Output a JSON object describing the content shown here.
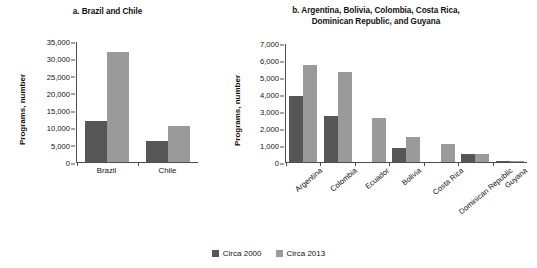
{
  "legend": {
    "items": [
      {
        "label": "Circa 2000",
        "color": "#565656"
      },
      {
        "label": "Circa 2013",
        "color": "#9a9a9a"
      }
    ]
  },
  "chart_data": [
    {
      "type": "bar",
      "panel": "a",
      "title": "a. Brazil and Chile",
      "xlabel": "",
      "ylabel": "Programs, number",
      "ylim": [
        0,
        35000
      ],
      "ytick_labels": [
        "0",
        "5,000",
        "10,000",
        "15,000",
        "20,000",
        "25,000",
        "30,000",
        "35,000"
      ],
      "ytick_values": [
        0,
        5000,
        10000,
        15000,
        20000,
        25000,
        30000,
        35000
      ],
      "grid": false,
      "legend_position": "bottom-center",
      "categories": [
        "Brazil",
        "Chile"
      ],
      "series": [
        {
          "name": "Circa 2000",
          "color": "#565656",
          "values": [
            12000,
            6200
          ]
        },
        {
          "name": "Circa 2013",
          "color": "#9a9a9a",
          "values": [
            32000,
            10500
          ]
        }
      ]
    },
    {
      "type": "bar",
      "panel": "b",
      "title": "b. Argentina, Bolivia, Colombia, Costa Rica, Dominican Republic, and Guyana",
      "title_line1": "b. Argentina, Bolivia, Colombia, Costa Rica,",
      "title_line2": "Dominican Republic, and Guyana",
      "xlabel": "",
      "ylabel": "Programs, number",
      "ylim": [
        0,
        7000
      ],
      "ytick_labels": [
        "0",
        "1,000",
        "2,000",
        "3,000",
        "4,000",
        "5,000",
        "6,000",
        "7,000"
      ],
      "ytick_values": [
        0,
        1000,
        2000,
        3000,
        4000,
        5000,
        6000,
        7000
      ],
      "grid": false,
      "legend_position": "bottom-center",
      "categories": [
        "Argentina",
        "Colombia",
        "Ecuador",
        "Bolivia",
        "Costa Rica",
        "Dominican Republic",
        "Guyana"
      ],
      "series": [
        {
          "name": "Circa 2000",
          "color": "#565656",
          "values": [
            3900,
            2750,
            null,
            850,
            null,
            500,
            60
          ]
        },
        {
          "name": "Circa 2013",
          "color": "#9a9a9a",
          "values": [
            5750,
            5350,
            2600,
            1500,
            1050,
            500,
            60
          ]
        }
      ]
    }
  ]
}
